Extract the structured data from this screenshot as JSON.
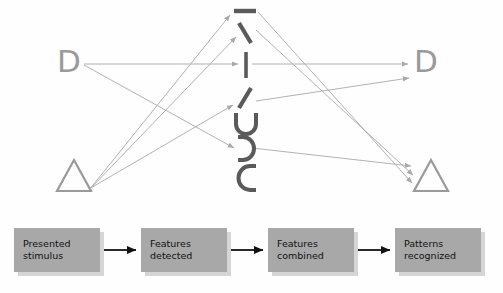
{
  "figure": {
    "title_visible": false,
    "colors": {
      "glyph_dark": "#5a5a5a",
      "glyph_gray": "#9a9a9a",
      "arrow_light": "#a9a9a9",
      "arrow_dark": "#111111",
      "box_fill": "#a8a8a8",
      "box_shadow": "#d5d5d5",
      "background": "#fefefe"
    }
  },
  "network": {
    "input_nodes": [
      {
        "id": "input-d",
        "label": "D",
        "kind": "letter-d"
      },
      {
        "id": "input-triangle",
        "label": "",
        "kind": "triangle"
      }
    ],
    "output_nodes": [
      {
        "id": "output-d",
        "label": "D",
        "kind": "letter-d"
      },
      {
        "id": "output-triangle",
        "label": "",
        "kind": "triangle"
      }
    ],
    "feature_detectors": [
      {
        "id": "feature-horizontal-bar",
        "glyph": "—",
        "name": "horizontal-line-feature"
      },
      {
        "id": "feature-backslash",
        "glyph": "\\",
        "name": "backslash-line-feature"
      },
      {
        "id": "feature-vertical-bar",
        "glyph": "|",
        "name": "vertical-line-feature"
      },
      {
        "id": "feature-forwardslash",
        "glyph": "/",
        "name": "forwardslash-line-feature"
      },
      {
        "id": "feature-cup-up",
        "glyph": "U",
        "name": "upward-curve-feature"
      },
      {
        "id": "feature-arc-right",
        "glyph": ")",
        "name": "right-arc-feature"
      },
      {
        "id": "feature-arc-left",
        "glyph": "C",
        "name": "left-arc-feature"
      }
    ],
    "input_connections": [
      {
        "from": "input-d",
        "to": "feature-vertical-bar"
      },
      {
        "from": "input-d",
        "to": "feature-arc-right"
      },
      {
        "from": "input-triangle",
        "to": "feature-horizontal-bar"
      },
      {
        "from": "input-triangle",
        "to": "feature-backslash"
      },
      {
        "from": "input-triangle",
        "to": "feature-forwardslash"
      }
    ],
    "output_connections": [
      {
        "from": "feature-horizontal-bar",
        "to": "output-triangle"
      },
      {
        "from": "feature-backslash",
        "to": "output-triangle"
      },
      {
        "from": "feature-vertical-bar",
        "to": "output-d"
      },
      {
        "from": "feature-forwardslash",
        "to": "output-triangle"
      },
      {
        "from": "feature-arc-right",
        "to": "output-d"
      }
    ]
  },
  "flow": {
    "steps": [
      {
        "id": "step-presented-stimulus",
        "label": "Presented\nstimulus"
      },
      {
        "id": "step-features-detected",
        "label": "Features\ndetected"
      },
      {
        "id": "step-features-combined",
        "label": "Features\ncombined"
      },
      {
        "id": "step-patterns-recognized",
        "label": "Patterns\nrecognized"
      }
    ],
    "arrow_count": 3
  }
}
